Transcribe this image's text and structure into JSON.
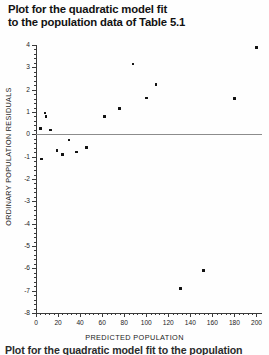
{
  "title": {
    "line1": "Plot for the quadratic model fit",
    "line2": "to the population data of Table 5.1"
  },
  "caption_partial": "Plot for the quadratic model fit to the population",
  "chart_data": {
    "type": "scatter",
    "title": "Plot for the quadratic model fit to the population data of Table 5.1",
    "xlabel": "PREDICTED POPULATION",
    "ylabel": "ORDINARY POPULATION RESIDUALS",
    "xlim": [
      0,
      205
    ],
    "ylim": [
      -8,
      4
    ],
    "xticks": [
      0,
      20,
      40,
      60,
      80,
      100,
      120,
      140,
      160,
      180,
      200
    ],
    "yticks": [
      4,
      3,
      2,
      1,
      0,
      -1,
      -2,
      -3,
      -4,
      -5,
      -6,
      -7,
      -8
    ],
    "xtick_labels": [
      "0",
      "20",
      "40",
      "60",
      "80",
      "100",
      "120",
      "140",
      "160",
      "180",
      "200"
    ],
    "ytick_labels": [
      "4",
      "3",
      "2",
      "1",
      "0",
      "-1",
      "-2",
      "-3",
      "-4",
      "-5",
      "-6",
      "-7",
      "-8"
    ],
    "grid": false,
    "legend": "none",
    "reference_line": {
      "orientation": "horizontal",
      "y": 0,
      "color": "#8c8c8c"
    },
    "marker": {
      "shape": "square",
      "color": "#111111",
      "size": 2.6
    },
    "points": [
      {
        "x": 4,
        "y": 0.25
      },
      {
        "x": 5,
        "y": -1.1
      },
      {
        "x": 8,
        "y": 0.95
      },
      {
        "x": 9,
        "y": 0.8
      },
      {
        "x": 13,
        "y": 0.2
      },
      {
        "x": 19,
        "y": -0.72
      },
      {
        "x": 24,
        "y": -0.9
      },
      {
        "x": 30,
        "y": -0.25
      },
      {
        "x": 37,
        "y": -0.8
      },
      {
        "x": 46,
        "y": -0.6
      },
      {
        "x": 62,
        "y": 0.8
      },
      {
        "x": 76,
        "y": 1.15
      },
      {
        "x": 88,
        "y": 3.15
      },
      {
        "x": 100,
        "y": 1.62
      },
      {
        "x": 109,
        "y": 2.22
      },
      {
        "x": 131,
        "y": -6.9
      },
      {
        "x": 152,
        "y": -6.1
      },
      {
        "x": 180,
        "y": 1.6
      },
      {
        "x": 200,
        "y": 3.9
      }
    ]
  }
}
